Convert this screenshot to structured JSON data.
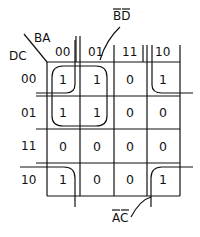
{
  "kmap": {
    "row_var_label": "DC",
    "col_var_label": "BA",
    "col_headers": [
      "00",
      "01",
      "11",
      "10"
    ],
    "row_headers": [
      "00",
      "01",
      "11",
      "10"
    ],
    "cells": [
      [
        "1",
        "1",
        "0",
        "1"
      ],
      [
        "1",
        "1",
        "0",
        "0"
      ],
      [
        "0",
        "0",
        "0",
        "0"
      ],
      [
        "1",
        "0",
        "0",
        "1"
      ]
    ]
  },
  "groups": [
    {
      "label": "B̄D̄",
      "label_base": "BD",
      "cells": "rows 00-01 × cols 00-01"
    },
    {
      "label": "ĀC̄",
      "label_base": "AC",
      "cells": "four corners"
    }
  ]
}
